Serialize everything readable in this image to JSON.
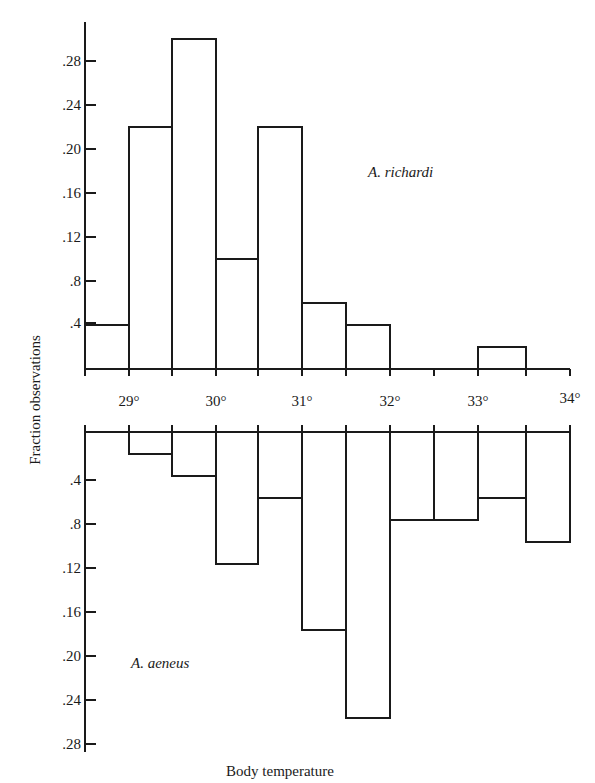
{
  "chart_data": {
    "type": "bar",
    "subtype": "mirrored-histogram",
    "xlabel": "Body temperature",
    "ylabel": "Fraction observations",
    "x_tick_labels": [
      "29°",
      "30°",
      "31°",
      "32°",
      "33°",
      "34°"
    ],
    "y_tick_labels": [
      ".4",
      ".8",
      ".12",
      ".16",
      ".20",
      ".24",
      ".28"
    ],
    "y_tick_values": [
      0.04,
      0.08,
      0.12,
      0.16,
      0.2,
      0.24,
      0.28
    ],
    "bin_edges": [
      28.5,
      29.0,
      29.5,
      30.0,
      30.5,
      31.0,
      31.5,
      32.0,
      32.5,
      33.0,
      33.5,
      34.0
    ],
    "categories": [
      "28.5-29.0",
      "29.0-29.5",
      "29.5-30.0",
      "30.0-30.5",
      "30.5-31.0",
      "31.0-31.5",
      "31.5-32.0",
      "32.0-32.5",
      "32.5-33.0",
      "33.0-33.5",
      "33.5-34.0"
    ],
    "series": [
      {
        "name": "A. richardi",
        "position": "top",
        "values": [
          0.04,
          0.22,
          0.3,
          0.1,
          0.22,
          0.06,
          0.04,
          0.0,
          0.0,
          0.02,
          0.0
        ]
      },
      {
        "name": "A. aeneus",
        "position": "bottom (inverted)",
        "values": [
          0.0,
          0.02,
          0.04,
          0.12,
          0.06,
          0.18,
          0.26,
          0.08,
          0.08,
          0.06,
          0.1
        ]
      }
    ],
    "ylim": [
      0,
      0.3
    ],
    "xlim": [
      28.5,
      34.0
    ],
    "grid": false,
    "legend": "inline species labels"
  },
  "labels": {
    "top_species": "A. richardi",
    "bottom_species": "A. aeneus",
    "x_axis_title": "Body temperature",
    "y_axis_title": "Fraction observations"
  }
}
